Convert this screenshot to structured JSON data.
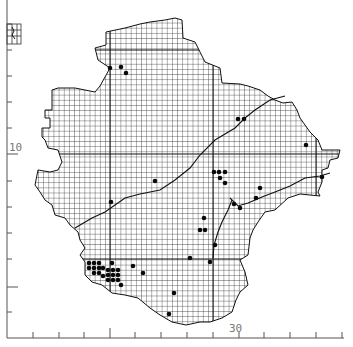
{
  "map": {
    "type": "grid distribution map",
    "axis": {
      "y_label": "10",
      "x_label": "30",
      "y_label_pos": [
        9,
        154
      ],
      "x_label_pos": [
        230,
        330
      ]
    },
    "grid_cell_px": 5.15,
    "colors": {
      "ink": "#111111",
      "grid": "#222222",
      "axis": "#555555",
      "dot": "#0a0a0a"
    },
    "records": [
      [
        110,
        68
      ],
      [
        121,
        67
      ],
      [
        126,
        73
      ],
      [
        238,
        119
      ],
      [
        244,
        119
      ],
      [
        306,
        145
      ],
      [
        214,
        172
      ],
      [
        219,
        172
      ],
      [
        225,
        172
      ],
      [
        220,
        178
      ],
      [
        225,
        183
      ],
      [
        322,
        177
      ],
      [
        155,
        181
      ],
      [
        260,
        188
      ],
      [
        256,
        198
      ],
      [
        111,
        202
      ],
      [
        234,
        204
      ],
      [
        240,
        208
      ],
      [
        204,
        218
      ],
      [
        200,
        230
      ],
      [
        205,
        230
      ],
      [
        215,
        245
      ],
      [
        190,
        258
      ],
      [
        210,
        262
      ],
      [
        112,
        263
      ],
      [
        133,
        266
      ],
      [
        89,
        263
      ],
      [
        94,
        263
      ],
      [
        99,
        263
      ],
      [
        89,
        268
      ],
      [
        94,
        268
      ],
      [
        99,
        268
      ],
      [
        103,
        268
      ],
      [
        94,
        273
      ],
      [
        99,
        273
      ],
      [
        108,
        270
      ],
      [
        113,
        270
      ],
      [
        118,
        270
      ],
      [
        108,
        275
      ],
      [
        113,
        275
      ],
      [
        118,
        275
      ],
      [
        108,
        280
      ],
      [
        113,
        280
      ],
      [
        118,
        280
      ],
      [
        103,
        276
      ],
      [
        121,
        285
      ],
      [
        143,
        273
      ],
      [
        174,
        293
      ],
      [
        169,
        314
      ]
    ]
  }
}
